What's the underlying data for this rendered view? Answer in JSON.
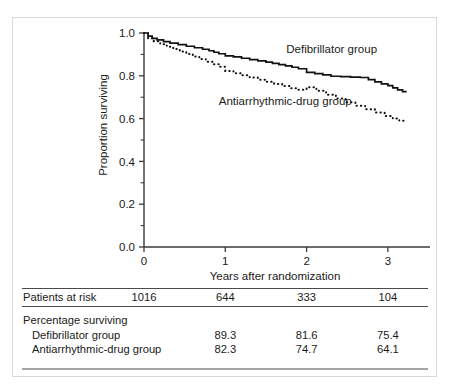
{
  "figure": {
    "background": "#ffffff",
    "frame_color": "#d8d8d8",
    "ink_color": "#111111"
  },
  "axes": {
    "y_title": "Proportion surviving",
    "x_title": "Years after randomization",
    "y_ticklabels": [
      "0.0",
      "0.2",
      "0.4",
      "0.6",
      "0.8",
      "1.0"
    ],
    "x_ticklabels": [
      "0",
      "1",
      "2",
      "3"
    ]
  },
  "series_labels": {
    "defibrillator": "Defibrillator group",
    "antiarrhythmic": "Antiarrhythmic-drug group"
  },
  "table": {
    "rows": [
      {
        "label": "Patients at risk",
        "values": [
          "1016",
          "644",
          "333",
          "104"
        ],
        "indent": false
      },
      {
        "label": "Percentage surviving",
        "values": [
          "",
          "",
          "",
          ""
        ],
        "indent": false
      },
      {
        "label": "Defibrillator group",
        "values": [
          "",
          "89.3",
          "81.6",
          "75.4"
        ],
        "indent": true
      },
      {
        "label": "Antiarrhythmic-drug group",
        "values": [
          "",
          "82.3",
          "74.7",
          "64.1"
        ],
        "indent": true
      }
    ]
  },
  "chart_data": {
    "type": "line",
    "title": "",
    "subtitle": "",
    "xlabel": "Years after randomization",
    "ylabel": "Proportion surviving",
    "xlim": [
      0,
      3.6
    ],
    "ylim": [
      0.0,
      1.0
    ],
    "xticks": [
      0,
      1,
      2,
      3
    ],
    "yticks": [
      0.0,
      0.2,
      0.4,
      0.6,
      0.8,
      1.0
    ],
    "y_minor_ticks": [
      0.1,
      0.3,
      0.5,
      0.7,
      0.9
    ],
    "grid": false,
    "legend_position": "inline-annotation",
    "annotations": [
      {
        "text": "Defibrillator group",
        "x": 1.75,
        "y": 0.905
      },
      {
        "text": "Antiarrhythmic-drug group",
        "x": 0.92,
        "y": 0.665
      }
    ],
    "series": [
      {
        "name": "Defibrillator group",
        "style": "solid",
        "step": "post",
        "x": [
          0.0,
          0.05,
          0.1,
          0.16,
          0.24,
          0.32,
          0.42,
          0.52,
          0.62,
          0.72,
          0.8,
          0.86,
          0.92,
          1.0,
          1.1,
          1.2,
          1.3,
          1.4,
          1.5,
          1.58,
          1.66,
          1.74,
          1.82,
          1.9,
          2.0,
          2.1,
          2.2,
          2.3,
          2.42,
          2.54,
          2.66,
          2.76,
          2.84,
          2.92,
          3.0,
          3.06,
          3.12,
          3.18,
          3.22
        ],
        "y": [
          1.0,
          0.985,
          0.975,
          0.968,
          0.96,
          0.953,
          0.946,
          0.938,
          0.931,
          0.924,
          0.917,
          0.91,
          0.903,
          0.893,
          0.888,
          0.882,
          0.876,
          0.87,
          0.864,
          0.858,
          0.852,
          0.846,
          0.84,
          0.833,
          0.816,
          0.81,
          0.804,
          0.798,
          0.796,
          0.794,
          0.792,
          0.782,
          0.772,
          0.762,
          0.754,
          0.744,
          0.734,
          0.726,
          0.722
        ]
      },
      {
        "name": "Antiarrhythmic-drug group",
        "style": "dotted",
        "step": "post",
        "x": [
          0.0,
          0.05,
          0.12,
          0.2,
          0.28,
          0.36,
          0.44,
          0.52,
          0.6,
          0.68,
          0.76,
          0.84,
          0.92,
          1.0,
          1.1,
          1.2,
          1.3,
          1.4,
          1.5,
          1.6,
          1.7,
          1.8,
          1.9,
          2.0,
          2.12,
          2.24,
          2.36,
          2.48,
          2.6,
          2.72,
          2.84,
          2.96,
          3.06,
          3.14,
          3.22
        ],
        "y": [
          1.0,
          0.975,
          0.962,
          0.948,
          0.936,
          0.925,
          0.913,
          0.902,
          0.89,
          0.878,
          0.866,
          0.854,
          0.842,
          0.823,
          0.812,
          0.802,
          0.792,
          0.782,
          0.772,
          0.762,
          0.752,
          0.742,
          0.735,
          0.747,
          0.73,
          0.712,
          0.694,
          0.676,
          0.66,
          0.644,
          0.628,
          0.612,
          0.6,
          0.59,
          0.583
        ]
      }
    ],
    "risk_table": {
      "times": [
        0,
        1,
        2,
        3
      ],
      "rows": [
        {
          "label": "Patients at risk",
          "values": [
            1016,
            644,
            333,
            104
          ]
        },
        {
          "label": "Percentage surviving: Defibrillator group",
          "values": [
            null,
            89.3,
            81.6,
            75.4
          ]
        },
        {
          "label": "Percentage surviving: Antiarrhythmic-drug group",
          "values": [
            null,
            82.3,
            74.7,
            64.1
          ]
        }
      ]
    }
  }
}
